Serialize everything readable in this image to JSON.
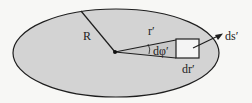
{
  "diagram": {
    "type": "disk-area-element",
    "colors": {
      "background": "#f7f7f5",
      "disk_fill": "#d3d3d3",
      "stroke": "#1e1e1e",
      "element_fill": "#f4f4f4"
    },
    "labels": {
      "radius": "R",
      "radial_coord": "r′",
      "angle_element": "dφ′",
      "radial_element": "dr′",
      "area_element": "ds′"
    }
  }
}
